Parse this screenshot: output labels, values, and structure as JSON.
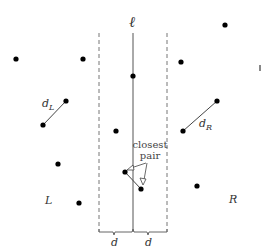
{
  "diagram": {
    "line_label": "ℓ",
    "region_left_label": "L",
    "region_right_label": "R",
    "dist_left_label": "d",
    "dist_left_sub": "L",
    "dist_right_label": "d",
    "dist_right_sub": "R",
    "strip_left_width_label": "d",
    "strip_right_width_label": "d",
    "annotation_line1": "closest",
    "annotation_line2": "pair",
    "colors": {
      "point": "#000000",
      "line": "#555555",
      "dashed": "#777777",
      "text": "#333333"
    },
    "points_left": [
      {
        "x": 16,
        "y": 59
      },
      {
        "x": 83,
        "y": 59
      },
      {
        "x": 66,
        "y": 101
      },
      {
        "x": 43,
        "y": 125
      },
      {
        "x": 58,
        "y": 164
      },
      {
        "x": 79,
        "y": 203
      }
    ],
    "points_strip": [
      {
        "x": 133,
        "y": 76
      },
      {
        "x": 116,
        "y": 131
      },
      {
        "x": 125,
        "y": 172
      },
      {
        "x": 141,
        "y": 189
      }
    ],
    "points_right": [
      {
        "x": 225,
        "y": 25
      },
      {
        "x": 181,
        "y": 62
      },
      {
        "x": 217,
        "y": 101
      },
      {
        "x": 183,
        "y": 131
      },
      {
        "x": 197,
        "y": 186
      }
    ]
  }
}
